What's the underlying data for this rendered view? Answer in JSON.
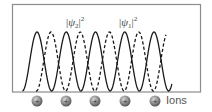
{
  "labels": {
    "psi2": {
      "bar_open": "|",
      "psi": "ψ",
      "sub": "2",
      "bar_close": "|",
      "sup": "2"
    },
    "psi1": {
      "bar_open": "|",
      "psi": "ψ",
      "sub": "1",
      "bar_close": "|",
      "sup": "2"
    },
    "ions": "Ions"
  },
  "ions": {
    "count": 5,
    "symbol": "+",
    "centers_x": [
      37,
      66,
      95,
      125,
      155
    ],
    "center_y": 101,
    "color": "#7a7a7a"
  },
  "waves": {
    "solid": {
      "name": "|ψ1|^2",
      "style": "solid",
      "peaks_x": [
        37,
        66,
        95,
        124,
        154
      ],
      "color": "#1a1a1a"
    },
    "dashed": {
      "name": "|ψ2|^2",
      "style": "dashed",
      "peaks_x": [
        51,
        80,
        109,
        138
      ],
      "color": "#1a1a1a"
    }
  },
  "frame": {
    "left": 12,
    "top": 4,
    "right": 200,
    "bottom": 92,
    "color": "#8c8c8c"
  }
}
